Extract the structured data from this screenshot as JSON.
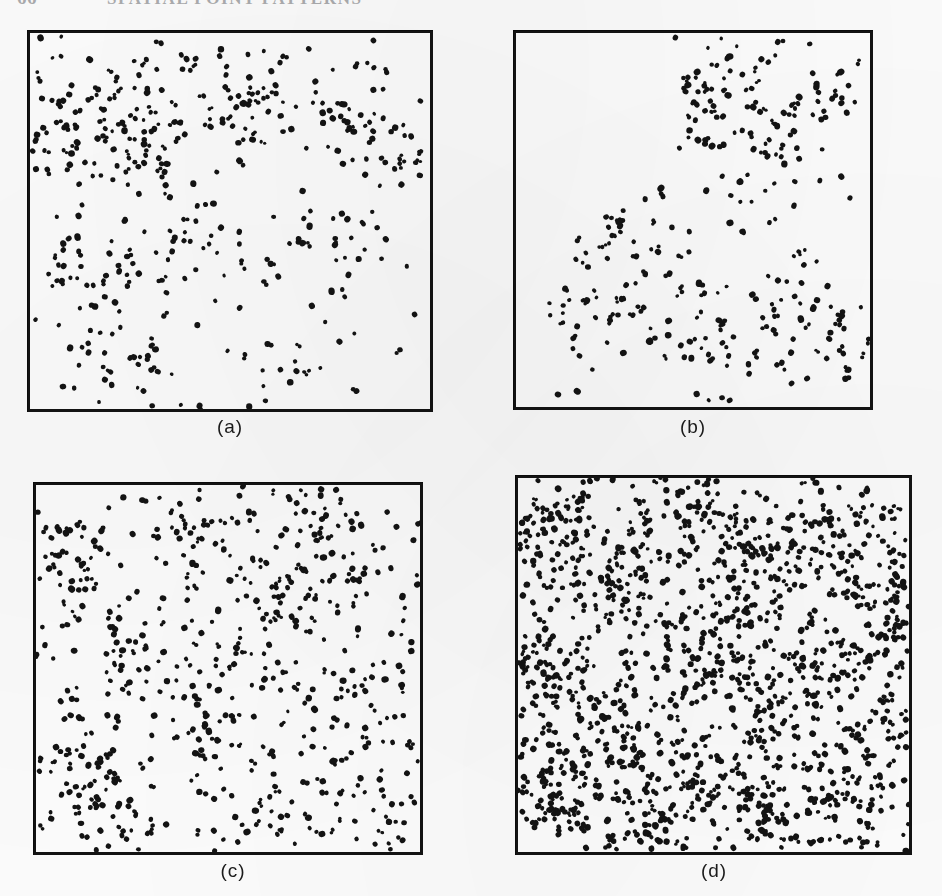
{
  "page": {
    "background_color": "#fdfdfd",
    "ink_color": "#131313",
    "width": 942,
    "height": 896
  },
  "header": {
    "folio": "66",
    "running_title": "SPATIAL POINT PATTERNS",
    "clipped": true
  },
  "figure": {
    "panels": [
      {
        "id": "a",
        "label": "(a)",
        "x": 27,
        "y": 30,
        "w": 406,
        "h": 382,
        "label_x": 190,
        "label_y": 416
      },
      {
        "id": "b",
        "label": "(b)",
        "x": 513,
        "y": 30,
        "w": 360,
        "h": 380,
        "label_x": 653,
        "label_y": 416
      },
      {
        "id": "c",
        "label": "(c)",
        "x": 33,
        "y": 482,
        "w": 390,
        "h": 373,
        "label_x": 193,
        "label_y": 860
      },
      {
        "id": "d",
        "label": "(d)",
        "x": 515,
        "y": 475,
        "w": 397,
        "h": 380,
        "label_x": 674,
        "label_y": 860
      }
    ]
  },
  "chart_data": {
    "type": "scatter",
    "title": "",
    "subtitle": "",
    "xlabel": "",
    "ylabel": "",
    "grid": false,
    "legend": null,
    "panels": [
      {
        "name": "(a)",
        "n_points": 430,
        "intensity": "low-moderate",
        "pattern": "clustered",
        "xlim": [
          0,
          1
        ],
        "ylim": [
          0,
          1
        ],
        "clusters": [
          {
            "cx": 0.1,
            "cy": 0.22,
            "sd": 0.085,
            "n": 60
          },
          {
            "cx": 0.16,
            "cy": 0.62,
            "sd": 0.09,
            "n": 52
          },
          {
            "cx": 0.3,
            "cy": 0.3,
            "sd": 0.08,
            "n": 44
          },
          {
            "cx": 0.47,
            "cy": 0.13,
            "sd": 0.075,
            "n": 30
          },
          {
            "cx": 0.61,
            "cy": 0.18,
            "sd": 0.08,
            "n": 34
          },
          {
            "cx": 0.82,
            "cy": 0.2,
            "sd": 0.075,
            "n": 30
          },
          {
            "cx": 0.93,
            "cy": 0.34,
            "sd": 0.07,
            "n": 28
          },
          {
            "cx": 0.72,
            "cy": 0.57,
            "sd": 0.08,
            "n": 26
          },
          {
            "cx": 0.43,
            "cy": 0.55,
            "sd": 0.085,
            "n": 24
          },
          {
            "cx": 0.22,
            "cy": 0.88,
            "sd": 0.08,
            "n": 28
          },
          {
            "cx": 0.58,
            "cy": 0.93,
            "sd": 0.075,
            "n": 22
          }
        ],
        "uniform_n": 52
      },
      {
        "name": "(b)",
        "n_points": 330,
        "intensity": "low, strongly inhomogeneous",
        "pattern": "clustered with a large empty upper-left region",
        "xlim": [
          0,
          1
        ],
        "ylim": [
          0,
          1
        ],
        "clusters": [
          {
            "cx": 0.46,
            "cy": 0.23,
            "sd": 0.07,
            "n": 34
          },
          {
            "cx": 0.63,
            "cy": 0.12,
            "sd": 0.075,
            "n": 32
          },
          {
            "cx": 0.84,
            "cy": 0.17,
            "sd": 0.08,
            "n": 30
          },
          {
            "cx": 0.7,
            "cy": 0.36,
            "sd": 0.075,
            "n": 30
          },
          {
            "cx": 0.33,
            "cy": 0.52,
            "sd": 0.075,
            "n": 34
          },
          {
            "cx": 0.21,
            "cy": 0.72,
            "sd": 0.08,
            "n": 32
          },
          {
            "cx": 0.49,
            "cy": 0.8,
            "sd": 0.085,
            "n": 34
          },
          {
            "cx": 0.76,
            "cy": 0.7,
            "sd": 0.08,
            "n": 30
          },
          {
            "cx": 0.93,
            "cy": 0.83,
            "sd": 0.075,
            "n": 26
          },
          {
            "cx": 0.58,
            "cy": 0.96,
            "sd": 0.065,
            "n": 20
          }
        ],
        "uniform_n": 28,
        "void_regions": [
          {
            "cx": 0.17,
            "cy": 0.22,
            "rx": 0.3,
            "ry": 0.26
          }
        ]
      },
      {
        "name": "(c)",
        "n_points": 620,
        "intensity": "moderate",
        "pattern": "clustered, more even coverage",
        "xlim": [
          0,
          1
        ],
        "ylim": [
          0,
          1
        ],
        "clusters": [
          {
            "cx": 0.06,
            "cy": 0.23,
            "sd": 0.06,
            "n": 34
          },
          {
            "cx": 0.09,
            "cy": 0.74,
            "sd": 0.07,
            "n": 34
          },
          {
            "cx": 0.24,
            "cy": 0.45,
            "sd": 0.075,
            "n": 36
          },
          {
            "cx": 0.21,
            "cy": 0.92,
            "sd": 0.07,
            "n": 32
          },
          {
            "cx": 0.4,
            "cy": 0.16,
            "sd": 0.075,
            "n": 34
          },
          {
            "cx": 0.46,
            "cy": 0.62,
            "sd": 0.08,
            "n": 36
          },
          {
            "cx": 0.62,
            "cy": 0.33,
            "sd": 0.07,
            "n": 32
          },
          {
            "cx": 0.7,
            "cy": 0.08,
            "sd": 0.07,
            "n": 30
          },
          {
            "cx": 0.79,
            "cy": 0.26,
            "sd": 0.075,
            "n": 34
          },
          {
            "cx": 0.84,
            "cy": 0.6,
            "sd": 0.075,
            "n": 32
          },
          {
            "cx": 0.67,
            "cy": 0.86,
            "sd": 0.08,
            "n": 34
          },
          {
            "cx": 0.93,
            "cy": 0.9,
            "sd": 0.07,
            "n": 28
          }
        ],
        "uniform_n": 224
      },
      {
        "name": "(d)",
        "n_points": 1450,
        "intensity": "high",
        "pattern": "clustered at high intensity, nearly space-filling",
        "xlim": [
          0,
          1
        ],
        "ylim": [
          0,
          1
        ],
        "clusters": [
          {
            "cx": 0.07,
            "cy": 0.12,
            "sd": 0.065,
            "n": 60
          },
          {
            "cx": 0.06,
            "cy": 0.5,
            "sd": 0.07,
            "n": 60
          },
          {
            "cx": 0.1,
            "cy": 0.86,
            "sd": 0.07,
            "n": 58
          },
          {
            "cx": 0.27,
            "cy": 0.28,
            "sd": 0.07,
            "n": 58
          },
          {
            "cx": 0.24,
            "cy": 0.66,
            "sd": 0.075,
            "n": 58
          },
          {
            "cx": 0.33,
            "cy": 0.95,
            "sd": 0.065,
            "n": 48
          },
          {
            "cx": 0.45,
            "cy": 0.1,
            "sd": 0.07,
            "n": 54
          },
          {
            "cx": 0.48,
            "cy": 0.45,
            "sd": 0.075,
            "n": 58
          },
          {
            "cx": 0.44,
            "cy": 0.8,
            "sd": 0.075,
            "n": 56
          },
          {
            "cx": 0.63,
            "cy": 0.24,
            "sd": 0.07,
            "n": 56
          },
          {
            "cx": 0.66,
            "cy": 0.62,
            "sd": 0.075,
            "n": 58
          },
          {
            "cx": 0.6,
            "cy": 0.93,
            "sd": 0.065,
            "n": 48
          },
          {
            "cx": 0.82,
            "cy": 0.14,
            "sd": 0.07,
            "n": 54
          },
          {
            "cx": 0.85,
            "cy": 0.48,
            "sd": 0.075,
            "n": 56
          },
          {
            "cx": 0.8,
            "cy": 0.82,
            "sd": 0.075,
            "n": 56
          },
          {
            "cx": 0.95,
            "cy": 0.32,
            "sd": 0.06,
            "n": 44
          },
          {
            "cx": 0.95,
            "cy": 0.7,
            "sd": 0.06,
            "n": 44
          }
        ],
        "uniform_n": 524
      }
    ]
  }
}
